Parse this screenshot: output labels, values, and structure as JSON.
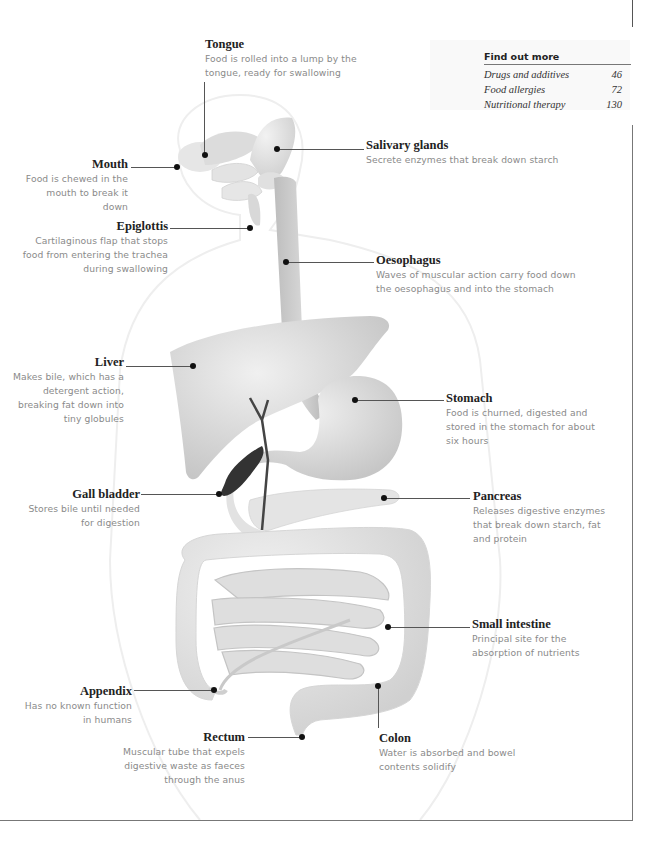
{
  "find_out_more": {
    "title": "Find out more",
    "items": [
      {
        "label": "Drugs and additives",
        "page": "46"
      },
      {
        "label": "Food allergies",
        "page": "72"
      },
      {
        "label": "Nutritional therapy",
        "page": "130"
      }
    ]
  },
  "labels": {
    "tongue": {
      "title": "Tongue",
      "desc_lines": [
        "Food is rolled into a lump by the",
        "tongue, ready for swallowing"
      ]
    },
    "salivary": {
      "title": "Salivary glands",
      "desc_lines": [
        "Secrete enzymes that break down starch"
      ]
    },
    "mouth": {
      "title": "Mouth",
      "desc_lines": [
        "Food is chewed in the",
        "mouth to break it down"
      ]
    },
    "epiglottis": {
      "title": "Epiglottis",
      "desc_lines": [
        "Cartilaginous flap that stops",
        "food from entering the trachea",
        "during swallowing"
      ]
    },
    "oesophagus": {
      "title": "Oesophagus",
      "desc_lines": [
        "Waves of muscular action carry food down",
        "the oesophagus and into the stomach"
      ]
    },
    "liver": {
      "title": "Liver",
      "desc_lines": [
        "Makes bile, which has a",
        "detergent action,",
        "breaking fat down into",
        "tiny globules"
      ]
    },
    "stomach": {
      "title": "Stomach",
      "desc_lines": [
        "Food is churned, digested and",
        "stored in the stomach for about",
        "six hours"
      ]
    },
    "gall_bladder": {
      "title": "Gall bladder",
      "desc_lines": [
        "Stores bile until needed",
        "for digestion"
      ]
    },
    "pancreas": {
      "title": "Pancreas",
      "desc_lines": [
        "Releases digestive enzymes",
        "that break down starch, fat",
        "and protein"
      ]
    },
    "small_intestine": {
      "title": "Small intestine",
      "desc_lines": [
        "Principal site for the",
        "absorption of nutrients"
      ]
    },
    "appendix": {
      "title": "Appendix",
      "desc_lines": [
        "Has no known function",
        "in humans"
      ]
    },
    "rectum": {
      "title": "Rectum",
      "desc_lines": [
        "Muscular tube that expels",
        "digestive waste as faeces",
        "through the anus"
      ]
    },
    "colon": {
      "title": "Colon",
      "desc_lines": [
        "Water is absorbed and bowel",
        "contents solidify"
      ]
    }
  },
  "colors": {
    "organ_fill": "#d9d9d9",
    "organ_shade": "#bdbdbd",
    "gall_bladder": "#3a3a3a",
    "body_outline": "#ececec",
    "leader": "#555555",
    "title_text": "#222222",
    "desc_text": "#8a8a8a"
  }
}
